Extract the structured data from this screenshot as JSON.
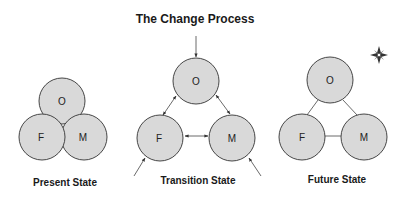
{
  "title": "The Change Process",
  "colors": {
    "circle_fill": "#d9d9d9",
    "circle_stroke": "#333333",
    "text": "#1a1a1a",
    "background": "#ffffff"
  },
  "states": [
    {
      "label": "Present State",
      "nodes": [
        {
          "id": "O",
          "label": "O"
        },
        {
          "id": "F",
          "label": "F"
        },
        {
          "id": "M",
          "label": "M"
        }
      ],
      "relation": "overlapping circles"
    },
    {
      "label": "Transition State",
      "nodes": [
        {
          "id": "O",
          "label": "O"
        },
        {
          "id": "F",
          "label": "F"
        },
        {
          "id": "M",
          "label": "M"
        }
      ],
      "relation": "separated circles with bidirectional arrows; external arrows into O, F and M"
    },
    {
      "label": "Future State",
      "nodes": [
        {
          "id": "O",
          "label": "O"
        },
        {
          "id": "F",
          "label": "F"
        },
        {
          "id": "M",
          "label": "M"
        }
      ],
      "relation": "separated circles connected by lines"
    }
  ],
  "icons": {
    "compass": "compass-rose-icon"
  }
}
